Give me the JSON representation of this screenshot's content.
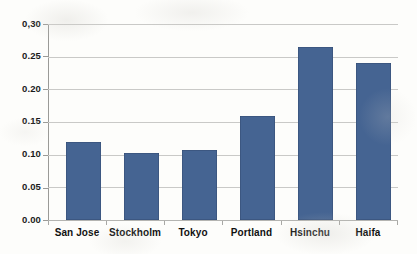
{
  "chart_data": {
    "type": "bar",
    "title": "",
    "subtitle": "",
    "xlabel": "",
    "ylabel": "",
    "categories": [
      "San Jose",
      "Stockholm",
      "Tokyo",
      "Portland",
      "Hsinchu",
      "Haifa"
    ],
    "values": [
      0.12,
      0.103,
      0.107,
      0.16,
      0.265,
      0.24
    ],
    "series": [
      {
        "name": "",
        "values": [
          0.12,
          0.103,
          0.107,
          0.16,
          0.265,
          0.24
        ]
      }
    ],
    "ylim": [
      0.0,
      0.3
    ],
    "yticks": [
      0.0,
      0.05,
      0.1,
      0.15,
      0.2,
      0.25,
      0.3
    ],
    "ytick_labels": [
      "0.00",
      "0.05",
      "0.10",
      "0.15",
      "0.20",
      "0.25",
      "0,30"
    ],
    "grid": true,
    "grid_axis": "y",
    "legend": false,
    "legend_position": "none",
    "bar_color": "#456492",
    "gridline_color": "#c9c9c7",
    "axis_color": "#9a9a97",
    "background_color": "#fdfdfb",
    "text_color": "#111111"
  }
}
